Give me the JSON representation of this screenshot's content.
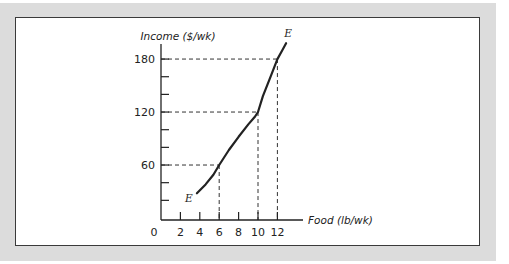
{
  "chart_data": {
    "type": "line",
    "title": "",
    "xlabel": "Food (lb/wk)",
    "ylabel": "Income ($/wk)",
    "xlim": [
      0,
      14.5
    ],
    "ylim": [
      0,
      200
    ],
    "x_ticks": [
      2,
      4,
      6,
      8,
      10,
      12
    ],
    "x_tick_labels": [
      "0",
      "2",
      "4",
      "6",
      "8",
      "10",
      "12"
    ],
    "y_ticks": [
      20,
      40,
      60,
      80,
      100,
      120,
      140,
      160,
      180
    ],
    "y_tick_labels": [
      {
        "value": 60,
        "label": "60"
      },
      {
        "value": 120,
        "label": "120"
      },
      {
        "value": 180,
        "label": "180"
      }
    ],
    "grid": false,
    "series": [
      {
        "name": "Engel curve",
        "label_start": "E",
        "label_end": "E",
        "points": [
          {
            "x": 3.7,
            "y": 28
          },
          {
            "x": 4.6,
            "y": 38
          },
          {
            "x": 5.4,
            "y": 49
          },
          {
            "x": 6,
            "y": 60
          },
          {
            "x": 7,
            "y": 77
          },
          {
            "x": 8,
            "y": 92
          },
          {
            "x": 9,
            "y": 106
          },
          {
            "x": 9.7,
            "y": 115
          },
          {
            "x": 10,
            "y": 120
          },
          {
            "x": 10.5,
            "y": 138
          },
          {
            "x": 11.3,
            "y": 160
          },
          {
            "x": 12,
            "y": 180
          },
          {
            "x": 12.5,
            "y": 190
          },
          {
            "x": 12.9,
            "y": 198
          }
        ]
      }
    ],
    "reference_lines": [
      {
        "x": 6,
        "y": 60
      },
      {
        "x": 10,
        "y": 120
      },
      {
        "x": 12,
        "y": 180
      }
    ]
  }
}
